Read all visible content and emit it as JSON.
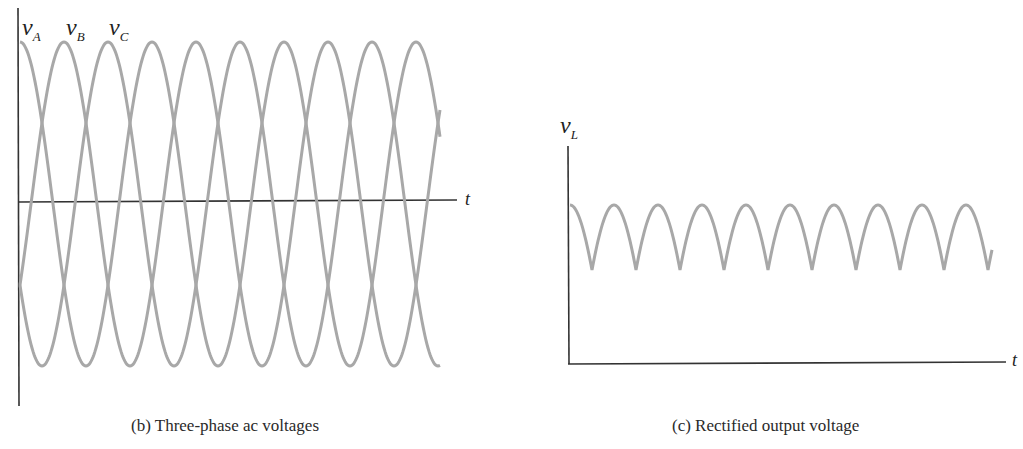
{
  "chart_data": [
    {
      "type": "line",
      "title": "(b) Three-phase ac voltages",
      "xlabel": "t",
      "ylabel": "",
      "legend": [
        "v_A",
        "v_B",
        "v_C"
      ],
      "series": [
        {
          "name": "v_A",
          "label_main": "v",
          "label_sub": "A",
          "phase_deg": 0
        },
        {
          "name": "v_B",
          "label_main": "v",
          "label_sub": "B",
          "phase_deg": -120
        },
        {
          "name": "v_C",
          "label_main": "v",
          "label_sub": "C",
          "phase_deg": -240
        }
      ],
      "periods_shown": 3.2,
      "grid": false,
      "color": "#a8a8a8",
      "axis_color": "#333333"
    },
    {
      "type": "line",
      "title": "(c) Rectified output voltage",
      "xlabel": "t",
      "ylabel": "v_L",
      "ylabel_main": "v",
      "ylabel_sub": "L",
      "series": [
        {
          "name": "v_L",
          "description": "max(v_A, v_B, v_C) ripple",
          "ripple_min_ratio": 0.5,
          "arches_shown": 10
        }
      ],
      "grid": false,
      "color": "#a8a8a8",
      "axis_color": "#333333"
    }
  ],
  "captions": {
    "left": "(b) Three-phase ac voltages",
    "right": "(c) Rectified output voltage"
  },
  "labels": {
    "vA_main": "v",
    "vA_sub": "A",
    "vB_main": "v",
    "vB_sub": "B",
    "vC_main": "v",
    "vC_sub": "C",
    "vL_main": "v",
    "vL_sub": "L",
    "t_left": "t",
    "t_right": "t"
  }
}
